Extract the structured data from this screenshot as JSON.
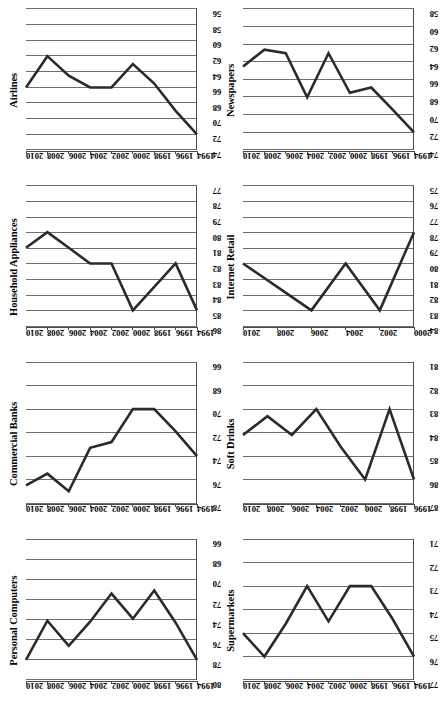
{
  "figure": {
    "orientation": "rotated-90-ccw",
    "panel_count": 8,
    "grid": "2 rows x 4 columns (as displayed upright)",
    "line_color": "#2b2b2b",
    "gridline_color": "#6f6f6f",
    "background": "#ffffff"
  },
  "chart_data": [
    {
      "type": "line",
      "title": "Personal Computers",
      "xlabel": "",
      "ylabel": "",
      "grid": true,
      "legend": "none",
      "categories": [
        "1994",
        "1996",
        "1998",
        "2000",
        "2002",
        "2004",
        "2006",
        "2008",
        "2010"
      ],
      "tick_labels": [
        "80",
        "78",
        "76",
        "74",
        "72",
        "70",
        "68",
        "66"
      ],
      "ylim": [
        66,
        80
      ],
      "values": [
        78.0,
        74.3,
        71.1,
        73.9,
        71.4,
        74.2,
        76.6,
        74.1,
        78.0
      ],
      "series": [
        {
          "name": "Personal Computers",
          "values": [
            78.0,
            74.3,
            71.1,
            73.9,
            71.4,
            74.2,
            76.6,
            74.1,
            78.0
          ]
        }
      ]
    },
    {
      "type": "line",
      "title": "Commercial Banks",
      "xlabel": "",
      "ylabel": "",
      "grid": true,
      "legend": "none",
      "categories": [
        "1994",
        "1996",
        "1998",
        "2000",
        "2002",
        "2004",
        "2006",
        "2008",
        "2010"
      ],
      "tick_labels": [
        "78",
        "76",
        "74",
        "72",
        "70",
        "68",
        "66"
      ],
      "ylim": [
        66,
        78
      ],
      "values": [
        74.0,
        71.9,
        70.0,
        70.0,
        72.8,
        73.3,
        77.0,
        75.5,
        76.5
      ],
      "series": [
        {
          "name": "Commercial Banks",
          "values": [
            74.0,
            71.9,
            70.0,
            70.0,
            72.8,
            73.3,
            77.0,
            75.5,
            76.5
          ]
        }
      ]
    },
    {
      "type": "line",
      "title": "Household Appliances",
      "xlabel": "",
      "ylabel": "",
      "grid": true,
      "legend": "none",
      "categories": [
        "1994",
        "1996",
        "1998",
        "2000",
        "2002",
        "2004",
        "2006",
        "2008",
        "2010"
      ],
      "tick_labels": [
        "86",
        "85",
        "84",
        "83",
        "82",
        "81",
        "80",
        "79",
        "78",
        "77"
      ],
      "ylim": [
        77,
        86
      ],
      "values": [
        85.0,
        82.0,
        83.5,
        85.0,
        82.0,
        82.0,
        81.0,
        80.0,
        81.0
      ],
      "series": [
        {
          "name": "Household Appliances",
          "values": [
            85.0,
            82.0,
            83.5,
            85.0,
            82.0,
            82.0,
            81.0,
            80.0,
            81.0
          ]
        }
      ]
    },
    {
      "type": "line",
      "title": "Airlines",
      "xlabel": "",
      "ylabel": "",
      "grid": true,
      "legend": "none",
      "categories": [
        "1994",
        "1996",
        "1998",
        "2000",
        "2002",
        "2004",
        "2006",
        "2008",
        "2010"
      ],
      "tick_labels": [
        "74",
        "72",
        "70",
        "68",
        "66",
        "64",
        "62",
        "60",
        "58",
        "56"
      ],
      "ylim": [
        56,
        74
      ],
      "values": [
        72.0,
        69.0,
        65.5,
        63.0,
        66.0,
        66.0,
        64.5,
        62.0,
        66.0
      ],
      "series": [
        {
          "name": "Airlines",
          "values": [
            72.0,
            69.0,
            65.5,
            63.0,
            66.0,
            66.0,
            64.5,
            62.0,
            66.0
          ]
        }
      ]
    },
    {
      "type": "line",
      "title": "Supermarkets",
      "xlabel": "",
      "ylabel": "",
      "grid": true,
      "legend": "none",
      "categories": [
        "1994",
        "1996",
        "1998",
        "2000",
        "2002",
        "2004",
        "2006",
        "2008",
        "2010"
      ],
      "tick_labels": [
        "77",
        "76",
        "75",
        "74",
        "73",
        "72",
        "71"
      ],
      "ylim": [
        71,
        77
      ],
      "values": [
        76.0,
        74.4,
        73.0,
        73.0,
        74.5,
        73.0,
        74.6,
        76.0,
        75.0
      ],
      "series": [
        {
          "name": "Supermarkets",
          "values": [
            76.0,
            74.4,
            73.0,
            73.0,
            74.5,
            73.0,
            74.6,
            76.0,
            75.0
          ]
        }
      ]
    },
    {
      "type": "line",
      "title": "Soft Drinks",
      "xlabel": "",
      "ylabel": "",
      "grid": true,
      "legend": "none",
      "categories": [
        "1996",
        "1998",
        "2000",
        "2002",
        "2004",
        "2006",
        "2008",
        "2010"
      ],
      "tick_labels": [
        "87",
        "86",
        "85",
        "84",
        "83",
        "82",
        "81"
      ],
      "ylim": [
        81,
        87
      ],
      "values": [
        86.0,
        83.0,
        86.0,
        84.6,
        83.0,
        84.1,
        83.3,
        84.1
      ],
      "series": [
        {
          "name": "Soft Drinks",
          "values": [
            86.0,
            83.0,
            86.0,
            84.6,
            83.0,
            84.1,
            83.3,
            84.1
          ]
        }
      ]
    },
    {
      "type": "line",
      "title": "Internet Retail",
      "xlabel": "",
      "ylabel": "",
      "grid": true,
      "legend": "none",
      "categories": [
        "2000",
        "2002",
        "2004",
        "2006",
        "2008",
        "2010"
      ],
      "tick_labels": [
        "84",
        "83",
        "82",
        "81",
        "80",
        "79",
        "78",
        "77",
        "76",
        "75"
      ],
      "ylim": [
        75,
        84
      ],
      "values": [
        78.0,
        83.0,
        80.0,
        83.0,
        81.5,
        80.0
      ],
      "series": [
        {
          "name": "Internet Retail",
          "values": [
            78.0,
            83.0,
            80.0,
            83.0,
            81.5,
            80.0
          ]
        }
      ]
    },
    {
      "type": "line",
      "title": "Newspapers",
      "xlabel": "",
      "ylabel": "",
      "grid": true,
      "legend": "none",
      "categories": [
        "1994",
        "1996",
        "1998",
        "2000",
        "2002",
        "2004",
        "2006",
        "2008",
        "2010"
      ],
      "tick_labels": [
        "74",
        "72",
        "70",
        "68",
        "66",
        "64",
        "62",
        "60",
        "58"
      ],
      "ylim": [
        58,
        74
      ],
      "values": [
        72.0,
        69.4,
        66.9,
        67.5,
        63.0,
        68.0,
        63.0,
        62.6,
        64.5
      ],
      "series": [
        {
          "name": "Newspapers",
          "values": [
            72.0,
            69.4,
            66.9,
            67.5,
            63.0,
            68.0,
            63.0,
            62.6,
            64.5
          ]
        }
      ]
    }
  ]
}
